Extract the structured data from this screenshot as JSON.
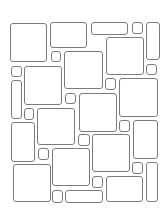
{
  "pattern": {
    "type": "versailles-stone-tile-pattern",
    "background_color": "#ffffff",
    "line_color": "#7a7a7a",
    "tiles": [
      {
        "x": 10,
        "y": 23,
        "w": 37,
        "h": 39
      },
      {
        "x": 50,
        "y": 22,
        "w": 37,
        "h": 26
      },
      {
        "x": 91,
        "y": 22,
        "w": 37,
        "h": 13
      },
      {
        "x": 132,
        "y": 22,
        "w": 11,
        "h": 12
      },
      {
        "x": 146,
        "y": 22,
        "w": 14,
        "h": 38
      },
      {
        "x": 51,
        "y": 51,
        "w": 10,
        "h": 11
      },
      {
        "x": 64,
        "y": 51,
        "w": 39,
        "h": 38
      },
      {
        "x": 106,
        "y": 37,
        "w": 38,
        "h": 38
      },
      {
        "x": 146,
        "y": 64,
        "w": 11,
        "h": 11
      },
      {
        "x": 11,
        "y": 66,
        "w": 11,
        "h": 11
      },
      {
        "x": 24,
        "y": 66,
        "w": 38,
        "h": 39
      },
      {
        "x": 11,
        "y": 80,
        "w": 11,
        "h": 39
      },
      {
        "x": 105,
        "y": 78,
        "w": 11,
        "h": 12
      },
      {
        "x": 119,
        "y": 78,
        "w": 39,
        "h": 39
      },
      {
        "x": 65,
        "y": 93,
        "w": 11,
        "h": 11
      },
      {
        "x": 79,
        "y": 93,
        "w": 38,
        "h": 39
      },
      {
        "x": 24,
        "y": 108,
        "w": 10,
        "h": 12
      },
      {
        "x": 37,
        "y": 108,
        "w": 38,
        "h": 37
      },
      {
        "x": 11,
        "y": 122,
        "w": 24,
        "h": 40
      },
      {
        "x": 119,
        "y": 120,
        "w": 11,
        "h": 12
      },
      {
        "x": 133,
        "y": 120,
        "w": 25,
        "h": 39
      },
      {
        "x": 78,
        "y": 134,
        "w": 12,
        "h": 12
      },
      {
        "x": 92,
        "y": 134,
        "w": 38,
        "h": 38
      },
      {
        "x": 38,
        "y": 148,
        "w": 11,
        "h": 12
      },
      {
        "x": 52,
        "y": 148,
        "w": 38,
        "h": 38
      },
      {
        "x": 13,
        "y": 164,
        "w": 38,
        "h": 38
      },
      {
        "x": 132,
        "y": 162,
        "w": 11,
        "h": 12
      },
      {
        "x": 146,
        "y": 162,
        "w": 12,
        "h": 40
      },
      {
        "x": 92,
        "y": 176,
        "w": 11,
        "h": 12
      },
      {
        "x": 106,
        "y": 176,
        "w": 37,
        "h": 26
      },
      {
        "x": 52,
        "y": 190,
        "w": 11,
        "h": 13
      },
      {
        "x": 65,
        "y": 190,
        "w": 38,
        "h": 13
      }
    ]
  }
}
